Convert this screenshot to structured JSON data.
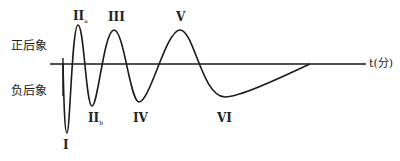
{
  "diagram": {
    "type": "afterimage-oscillation",
    "axis": {
      "label": "t(分)"
    },
    "side_labels": {
      "positive": "正后象",
      "negative": "负后象"
    },
    "phases": [
      {
        "id": "I",
        "label": "I",
        "sub": "",
        "polarity": "negative"
      },
      {
        "id": "IIa",
        "label": "II",
        "sub": "a",
        "polarity": "positive"
      },
      {
        "id": "IIb",
        "label": "II",
        "sub": "b",
        "polarity": "negative"
      },
      {
        "id": "III",
        "label": "III",
        "sub": "",
        "polarity": "positive"
      },
      {
        "id": "IV",
        "label": "IV",
        "sub": "",
        "polarity": "negative"
      },
      {
        "id": "V",
        "label": "V",
        "sub": "",
        "polarity": "positive"
      },
      {
        "id": "VI",
        "label": "VI",
        "sub": "",
        "polarity": "negative"
      }
    ],
    "colors": {
      "line": "#1a1a1a",
      "text": "#222222",
      "background": "#ffffff"
    }
  }
}
